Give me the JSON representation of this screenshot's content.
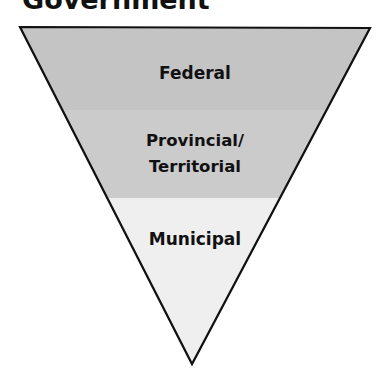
{
  "title": "Government",
  "diagram": {
    "type": "inverted-triangle",
    "levels": [
      {
        "label": "Federal",
        "color": "#c4c4c4"
      },
      {
        "label_line1": "Provincial/",
        "label_line2": "Territorial",
        "color": "#cbcbcb"
      },
      {
        "label": "Municipal",
        "color": "#efefef"
      }
    ],
    "outline_color": "#111111"
  }
}
